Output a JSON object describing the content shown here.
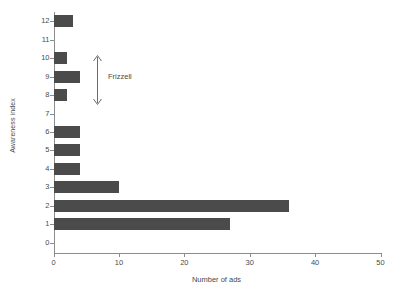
{
  "chart_data": {
    "type": "bar",
    "orientation": "horizontal",
    "title": "",
    "xlabel": "Number of ads",
    "ylabel": "Awareness index",
    "categories": [
      "0",
      "1",
      "2",
      "3",
      "4",
      "5",
      "6",
      "7",
      "8",
      "9",
      "10",
      "11",
      "12"
    ],
    "values": [
      0,
      27,
      36,
      10,
      4,
      4,
      4,
      0,
      2,
      4,
      2,
      0,
      3
    ],
    "xlim": [
      0,
      50
    ],
    "xticks": [
      0,
      10,
      20,
      30,
      40,
      50
    ],
    "xtick_labels": [
      "0",
      "10",
      "20",
      "30",
      "40",
      "50"
    ],
    "yticks": [
      0,
      1,
      2,
      3,
      4,
      5,
      6,
      7,
      8,
      9,
      10,
      11,
      12
    ],
    "ytick_labels": [
      "0",
      "1",
      "2",
      "3",
      "4",
      "5",
      "6",
      "7",
      "8",
      "9",
      "10",
      "11",
      "12"
    ],
    "grid": false,
    "legend": null,
    "bar_color": "#4b4b4b",
    "axis_color": "#8c8c8c",
    "annotations": [
      {
        "text": "Frizzell",
        "type": "double-headed-arrow",
        "spans_categories": [
          "7",
          "10"
        ]
      }
    ]
  },
  "annotation": {
    "frizzell_label": "Frizzell"
  },
  "icons": {
    "arrow_up": "arrow-up-icon",
    "arrow_down": "arrow-down-icon"
  }
}
